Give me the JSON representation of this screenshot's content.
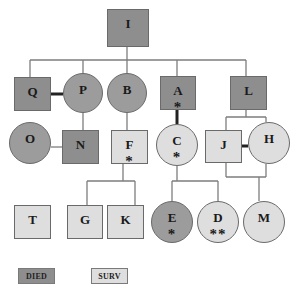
{
  "colors": {
    "died_square": "#8e8e8e",
    "died_circle": "#9c9c9c",
    "surv": "#dedede",
    "line": "#7d7d7d",
    "marriage_line": "#222222"
  },
  "nodes": [
    {
      "id": "I",
      "label": "I",
      "shape": "square",
      "status": "died",
      "mark": "",
      "x": 107,
      "y": 9,
      "w": 42,
      "h": 38
    },
    {
      "id": "Q",
      "label": "Q",
      "shape": "square",
      "status": "died",
      "mark": "",
      "x": 14,
      "y": 77,
      "w": 37,
      "h": 34
    },
    {
      "id": "P",
      "label": "P",
      "shape": "circle",
      "status": "died",
      "mark": "",
      "x": 63,
      "y": 73,
      "w": 40,
      "h": 40
    },
    {
      "id": "B",
      "label": "B",
      "shape": "circle",
      "status": "died",
      "mark": "",
      "x": 107,
      "y": 73,
      "w": 40,
      "h": 40
    },
    {
      "id": "A",
      "label": "A",
      "shape": "square",
      "status": "died",
      "mark": "*",
      "x": 160,
      "y": 76,
      "w": 36,
      "h": 34
    },
    {
      "id": "L",
      "label": "L",
      "shape": "square",
      "status": "died",
      "mark": "",
      "x": 230,
      "y": 76,
      "w": 37,
      "h": 34
    },
    {
      "id": "O",
      "label": "O",
      "shape": "circle",
      "status": "died",
      "mark": "",
      "x": 9,
      "y": 122,
      "w": 42,
      "h": 42
    },
    {
      "id": "N",
      "label": "N",
      "shape": "square",
      "status": "died",
      "mark": "",
      "x": 62,
      "y": 130,
      "w": 37,
      "h": 34
    },
    {
      "id": "F",
      "label": "F",
      "shape": "square",
      "status": "surv",
      "mark": "*",
      "x": 111,
      "y": 130,
      "w": 37,
      "h": 34
    },
    {
      "id": "C",
      "label": "C",
      "shape": "circle",
      "status": "surv",
      "mark": "*",
      "x": 156,
      "y": 124,
      "w": 42,
      "h": 42
    },
    {
      "id": "J",
      "label": "J",
      "shape": "square",
      "status": "surv",
      "mark": "",
      "x": 205,
      "y": 130,
      "w": 37,
      "h": 33
    },
    {
      "id": "H",
      "label": "H",
      "shape": "circle",
      "status": "surv",
      "mark": "",
      "x": 248,
      "y": 122,
      "w": 42,
      "h": 42
    },
    {
      "id": "T",
      "label": "T",
      "shape": "square",
      "status": "surv",
      "mark": "",
      "x": 14,
      "y": 205,
      "w": 37,
      "h": 34
    },
    {
      "id": "G",
      "label": "G",
      "shape": "square",
      "status": "surv",
      "mark": "",
      "x": 67,
      "y": 205,
      "w": 36,
      "h": 34
    },
    {
      "id": "K",
      "label": "K",
      "shape": "square",
      "status": "surv",
      "mark": "",
      "x": 107,
      "y": 205,
      "w": 37,
      "h": 34
    },
    {
      "id": "E",
      "label": "E",
      "shape": "circle",
      "status": "died",
      "mark": "*",
      "x": 151,
      "y": 201,
      "w": 42,
      "h": 42
    },
    {
      "id": "D",
      "label": "D",
      "shape": "circle",
      "status": "surv",
      "mark": "**",
      "x": 197,
      "y": 201,
      "w": 42,
      "h": 42
    },
    {
      "id": "M",
      "label": "M",
      "shape": "circle",
      "status": "surv",
      "mark": "",
      "x": 243,
      "y": 201,
      "w": 42,
      "h": 42
    }
  ],
  "edges": {
    "thin": [
      "M127 47 L127 60",
      "M30 60 L246 60",
      "M30 60 L30 77",
      "M83 60 L83 73",
      "M127 60 L127 73",
      "M177 60 L177 76",
      "M246 60 L246 76",
      "M83 113 L83 130",
      "M51 147 L62 147",
      "M127 113 L127 130",
      "M246 110 L246 117",
      "M226 117 L266 117",
      "M226 117 L226 130",
      "M266 117 L266 122",
      "M123 164 L123 181",
      "M87 181 L135 181",
      "M87 181 L87 205",
      "M135 181 L135 205",
      "M177 166 L177 181",
      "M172 181 L218 181",
      "M172 181 L172 201",
      "M218 181 L218 201",
      "M226 163 L226 177",
      "M266 164 L266 177",
      "M226 177 L266 177",
      "M259 177 L259 201"
    ],
    "marriage": [
      "M51 94 L63 94",
      "M177 110 L177 124",
      "M242 146 L248 146"
    ]
  },
  "legend": [
    {
      "label": "DIED",
      "status": "died",
      "x": 18,
      "y": 268,
      "w": 37,
      "h": 16
    },
    {
      "label": "SURV",
      "status": "surv",
      "x": 91,
      "y": 268,
      "w": 37,
      "h": 16
    }
  ]
}
